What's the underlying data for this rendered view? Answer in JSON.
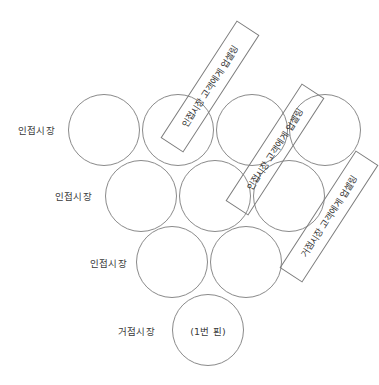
{
  "diagram": {
    "title_visible": false,
    "background_color": "#ffffff",
    "circle_stroke_color": "#8a8a8a",
    "callout_stroke_color": "#7d7d7d",
    "text_color": "#3a3a3a",
    "row_labels": [
      {
        "id": "row-1",
        "text": "인접시장"
      },
      {
        "id": "row-2",
        "text": "인접시장"
      },
      {
        "id": "row-3",
        "text": "인접시장"
      },
      {
        "id": "row-4",
        "text": "거점시장"
      }
    ],
    "pins": [
      {
        "id": "pin-r1-c1",
        "label": ""
      },
      {
        "id": "pin-r1-c2",
        "label": ""
      },
      {
        "id": "pin-r1-c3",
        "label": ""
      },
      {
        "id": "pin-r1-c4",
        "label": ""
      },
      {
        "id": "pin-r2-c1",
        "label": ""
      },
      {
        "id": "pin-r2-c2",
        "label": ""
      },
      {
        "id": "pin-r2-c3",
        "label": ""
      },
      {
        "id": "pin-r3-c1",
        "label": ""
      },
      {
        "id": "pin-r3-c2",
        "label": ""
      },
      {
        "id": "pin-r4-c1",
        "label": "(1번 핀)"
      }
    ],
    "callouts": [
      {
        "id": "callout-1",
        "text": "인접시장 고객에게 업셀링"
      },
      {
        "id": "callout-2",
        "text": "인접시장 고객에게 업셀링"
      },
      {
        "id": "callout-3",
        "text": "거점시장 고객에게 업셀링"
      }
    ]
  }
}
